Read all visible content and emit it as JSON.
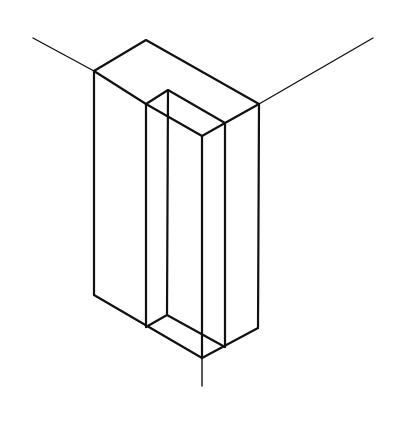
{
  "diagram": {
    "type": "isometric-line-drawing",
    "description": "Isometric view of a rectangular block with a rectangular notch cut into the front-right face, drawn on isometric axes",
    "stroke_color": "#111111",
    "background": "#ffffff",
    "axes": [
      {
        "name": "left-axis",
        "from": [
          33,
          38
        ],
        "to": [
          94,
          71
        ]
      },
      {
        "name": "right-axis",
        "from": [
          373,
          38
        ],
        "to": [
          259,
          104
        ]
      },
      {
        "name": "vertical-axis",
        "from": [
          202,
          358
        ],
        "to": [
          202,
          386
        ]
      }
    ],
    "vertices": {
      "outer_top_left": [
        94,
        71
      ],
      "outer_top_back": [
        146,
        40
      ],
      "outer_top_right": [
        259,
        104
      ],
      "inner_top_left": [
        146,
        104
      ],
      "inner_top_back": [
        168,
        90
      ],
      "inner_top_right": [
        225,
        123
      ],
      "inner_top_front": [
        202,
        136
      ],
      "outer_bottom_left": [
        94,
        295
      ],
      "outer_bottom_front": [
        202,
        358
      ],
      "outer_bottom_right": [
        258,
        328
      ],
      "inner_bottom_left": [
        146,
        327
      ],
      "inner_bottom_back": [
        167,
        315
      ],
      "inner_bottom_right": [
        225,
        347
      ]
    }
  }
}
